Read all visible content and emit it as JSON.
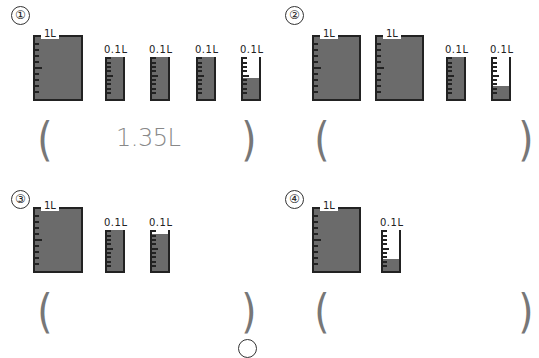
{
  "problems": [
    {
      "number": "①",
      "answer": "1.35L",
      "containers": [
        {
          "capacity": "1L",
          "fill_percent": 100
        },
        {
          "capacity": "0.1L",
          "fill_percent": 100
        },
        {
          "capacity": "0.1L",
          "fill_percent": 100
        },
        {
          "capacity": "0.1L",
          "fill_percent": 100
        },
        {
          "capacity": "0.1L",
          "fill_percent": 50
        }
      ]
    },
    {
      "number": "②",
      "answer": "",
      "containers": [
        {
          "capacity": "1L",
          "fill_percent": 100
        },
        {
          "capacity": "1L",
          "fill_percent": 100
        },
        {
          "capacity": "0.1L",
          "fill_percent": 100
        },
        {
          "capacity": "0.1L",
          "fill_percent": 30
        }
      ]
    },
    {
      "number": "③",
      "answer": "",
      "containers": [
        {
          "capacity": "1L",
          "fill_percent": 100
        },
        {
          "capacity": "0.1L",
          "fill_percent": 100
        },
        {
          "capacity": "0.1L",
          "fill_percent": 90
        }
      ]
    },
    {
      "number": "④",
      "answer": "",
      "containers": [
        {
          "capacity": "1L",
          "fill_percent": 100
        },
        {
          "capacity": "0.1L",
          "fill_percent": 30
        }
      ]
    }
  ],
  "parens": {
    "open": "(",
    "close": ")"
  },
  "colors": {
    "water": "#6b6b6b",
    "outline": "#222222",
    "answer_text": "#888888",
    "paren": "#777777"
  }
}
